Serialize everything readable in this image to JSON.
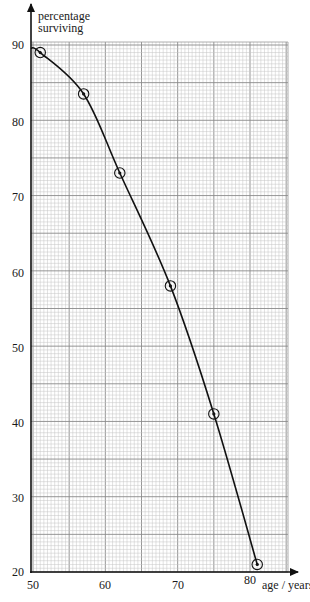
{
  "chart_data": {
    "type": "line",
    "title": "",
    "xlabel": "age / years",
    "ylabel": "percentage surviving",
    "xlim": [
      50,
      82
    ],
    "ylim": [
      20,
      90
    ],
    "xticks": [
      50,
      60,
      70,
      80
    ],
    "yticks": [
      20,
      30,
      40,
      50,
      60,
      70,
      80,
      90
    ],
    "grid": true,
    "legend": null,
    "series": [
      {
        "name": "percentage surviving",
        "marker": "circled-dot",
        "curve": "smooth",
        "x": [
          51,
          57,
          62,
          69,
          75,
          81
        ],
        "y": [
          89,
          83.5,
          73,
          58,
          41,
          21
        ]
      }
    ]
  },
  "labels": {
    "y_axis_line1": "percentage",
    "y_axis_line2": "surviving",
    "x_axis": "age / years",
    "x_ticks": [
      "50",
      "60",
      "70",
      "80"
    ],
    "y_ticks": [
      "90",
      "80",
      "70",
      "60",
      "50",
      "40",
      "30",
      "20"
    ]
  }
}
